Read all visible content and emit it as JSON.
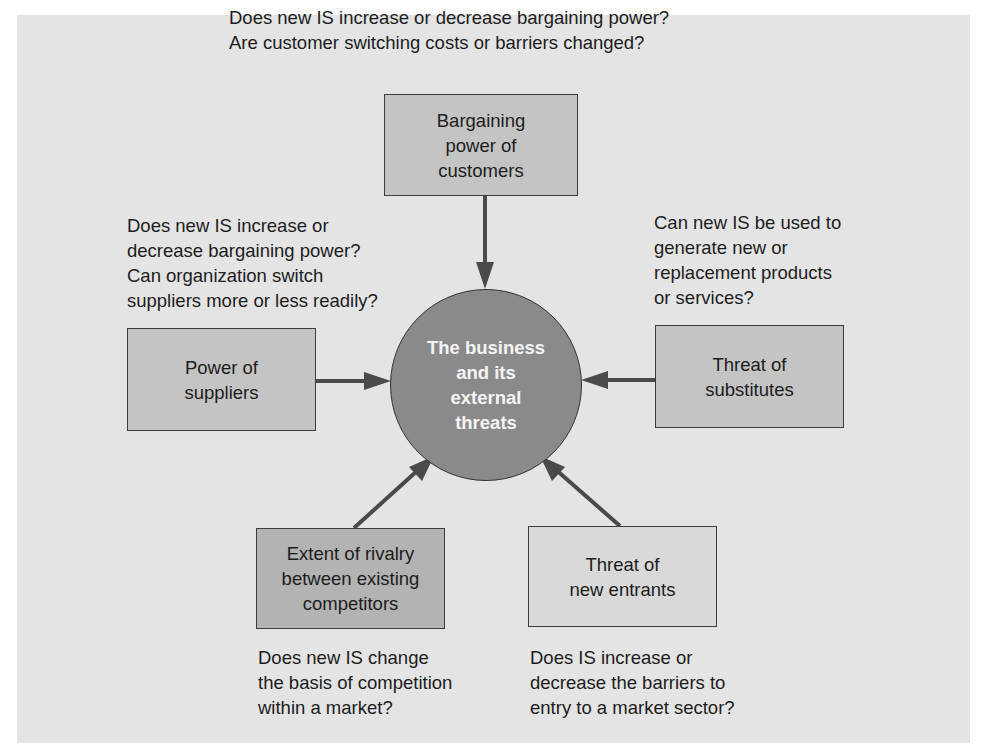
{
  "diagram": {
    "center": {
      "label": "The business\nand its\nexternal\nthreats",
      "color": "#8a8a8a"
    },
    "forces": {
      "customers": {
        "label": "Bargaining\npower of\ncustomers",
        "question_lines": [
          "Does new IS increase or decrease bargaining power?",
          "Are customer switching costs or barriers changed?"
        ]
      },
      "suppliers": {
        "label": "Power of\nsuppliers",
        "question_lines": [
          "Does new IS increase or",
          "decrease bargaining power?",
          "Can organization switch",
          "suppliers more or less readily?"
        ]
      },
      "substitutes": {
        "label": "Threat of\nsubstitutes",
        "question_lines": [
          "Can new IS be used to",
          "generate new or",
          "replacement products",
          "or services?"
        ]
      },
      "rivalry": {
        "label": "Extent of rivalry\nbetween existing\ncompetitors",
        "question_lines": [
          "Does new IS change",
          "the basis of competition",
          "within a market?"
        ]
      },
      "new_entrants": {
        "label": "Threat of\nnew entrants",
        "question_lines": [
          "Does IS increase or",
          "decrease the barriers to",
          "entry to a market sector?"
        ]
      }
    },
    "colors": {
      "panel": "#e4e4e4",
      "arrow": "#4a4a4a",
      "box_outline": "#3c3c3c"
    }
  }
}
